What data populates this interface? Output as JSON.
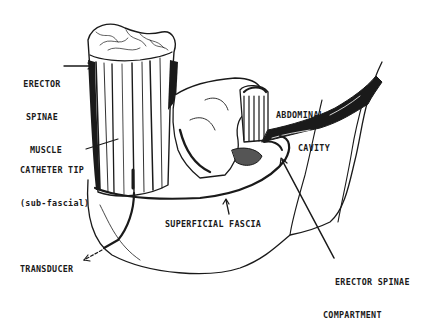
{
  "figure": {
    "type": "anatomical cross-section illustration",
    "colors": {
      "ink": "#1a1a1a",
      "background": "#ffffff"
    },
    "labels": {
      "erector_spinae_muscle": [
        "ERECTOR",
        "SPINAE",
        "MUSCLE"
      ],
      "abdominal_cavity": [
        "ABDOMINAL",
        "CAVITY"
      ],
      "catheter_tip": [
        "CATHETER TIP",
        "(sub-fascial)"
      ],
      "superficial_fascia": "SUPERFICIAL FASCIA",
      "erector_spinae_compartment": [
        "ERECTOR SPINAE",
        "COMPARTMENT"
      ],
      "transducer": "TRANSDUCER",
      "figure_number_fragment": "F..."
    }
  }
}
